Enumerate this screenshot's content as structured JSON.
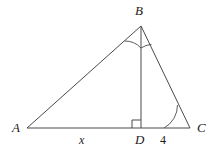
{
  "figure": {
    "type": "geometry-diagram",
    "shape": "triangle-with-altitude",
    "background_color": "#ffffff",
    "stroke_color": "#4a4a4a",
    "text_color": "#1a1a1a"
  },
  "vertices": {
    "a": {
      "label": "A",
      "x": 27,
      "y": 128,
      "label_x": 12,
      "label_y": 121
    },
    "b": {
      "label": "B",
      "x": 141,
      "y": 26,
      "label_x": 135,
      "label_y": 4
    },
    "c": {
      "label": "C",
      "x": 190,
      "y": 128,
      "label_x": 197,
      "label_y": 121
    },
    "d": {
      "label": "D",
      "x": 141,
      "y": 128,
      "label_x": 135,
      "label_y": 133
    }
  },
  "segments": {
    "ab": {
      "name": "side-AB"
    },
    "bc": {
      "name": "side-BC"
    },
    "ac": {
      "name": "base-AC"
    },
    "bd": {
      "name": "altitude-BD"
    }
  },
  "measures": {
    "ad": {
      "label": "x",
      "label_x": 79,
      "label_y": 134
    },
    "dc": {
      "label": "4",
      "label_x": 160,
      "label_y": 134
    }
  },
  "markers": {
    "right_angle_at_d": {
      "name": "right-angle-square",
      "size": 8
    },
    "arc_abd": {
      "name": "angle-arc-ABD"
    },
    "arc_dbc": {
      "name": "angle-arc-DBC"
    },
    "arc_c": {
      "name": "angle-arc-C"
    }
  }
}
